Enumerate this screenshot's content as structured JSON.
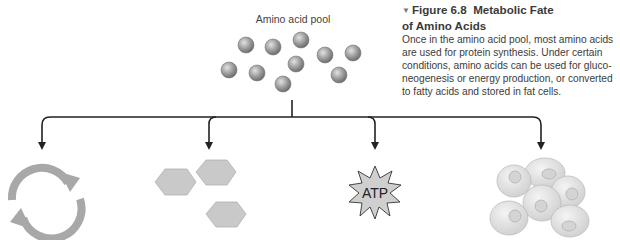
{
  "figure": {
    "marker": "▼",
    "number": "Figure 6.8",
    "title_line1": "Metabolic Fate",
    "title_line2": "of Amino Acids",
    "caption": "Once in the amino acid pool, most amino acids are used for protein synthesis. Under certain conditions, amino acids can be used for gluco-neogenesis or energy production, or converted to fatty acids and stored in fat cells.",
    "caption_lines": [
      "Once in the amino acid pool, most amino acids",
      "are used for protein synthesis. Under certain",
      "conditions, amino acids can be used for gluco-",
      "neogenesis or energy production, or converted",
      "to fatty acids and stored in fat cells."
    ]
  },
  "diagram": {
    "pool_label": "Amino acid pool",
    "amino_acid_count": 10,
    "branches": [
      {
        "id": "protein-synthesis",
        "icon": "recycle-arrows-icon"
      },
      {
        "id": "gluconeogenesis",
        "icon": "hexagon-glucose-icon"
      },
      {
        "id": "energy-production",
        "icon": "atp-burst-icon",
        "label": "ATP"
      },
      {
        "id": "fat-storage",
        "icon": "fat-cells-icon"
      }
    ],
    "colors": {
      "line": "#222222",
      "sphere": "#9a9a9a",
      "icon_gray": "#a8a8a8",
      "hexagon": "#c8c8c8",
      "fat_cell": "#e4e4e4"
    }
  }
}
